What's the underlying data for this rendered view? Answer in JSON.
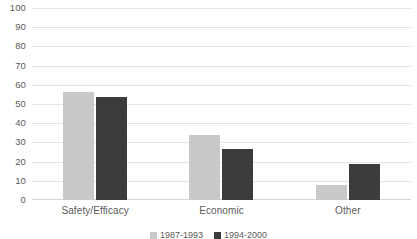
{
  "chart_data": {
    "type": "bar",
    "title": "",
    "subtitle": "",
    "xlabel": "",
    "ylabel": "",
    "ylim": [
      0,
      100
    ],
    "yticks": [
      "0",
      "10",
      "20",
      "30",
      "40",
      "50",
      "60",
      "70",
      "80",
      "90",
      "100"
    ],
    "grid": true,
    "legend_position": "bottom",
    "categories": [
      "Safety/Efficacy",
      "Economic",
      "Other"
    ],
    "series": [
      {
        "name": "1987-1993",
        "color": "#c9c9c9",
        "values": [
          56.5,
          34,
          8
        ]
      },
      {
        "name": "1994-2000",
        "color": "#3c3c3c",
        "values": [
          53.5,
          26.5,
          18.5
        ]
      }
    ]
  },
  "colors": {
    "series_light": "#c9c9c9",
    "series_dark": "#3c3c3c",
    "gridline": "#e4e4e4",
    "axis": "#d4d4d4",
    "text": "#5a5a5a",
    "background": "#ffffff"
  }
}
